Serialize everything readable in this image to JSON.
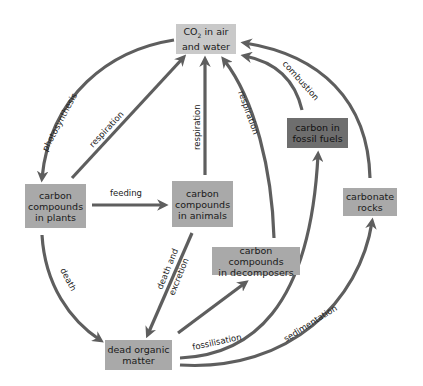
{
  "diagram": {
    "colors": {
      "arrow": "#5e5e5e",
      "box_light": "#c9c9c9",
      "box_mid": "#a9a9a9",
      "box_dark": "#6e6e6e"
    },
    "nodes": {
      "co2": {
        "line1": "CO",
        "sub": "2",
        "line1b": " in air",
        "line2": "and water"
      },
      "plants": {
        "line1": "carbon",
        "line2": "compounds",
        "line3": "in plants"
      },
      "animals": {
        "line1": "carbon",
        "line2": "compounds",
        "line3": "in animals"
      },
      "decomposers": {
        "line1": "carbon compounds",
        "line2": "in decomposers"
      },
      "dead_matter": {
        "line1": "dead organic",
        "line2": "matter"
      },
      "fossil_fuels": {
        "line1": "carbon in",
        "line2": "fossil fuels"
      },
      "carbonate_rocks": {
        "line1": "carbonate",
        "line2": "rocks"
      }
    },
    "edges": [
      {
        "from": "co2",
        "to": "plants",
        "label": "photosynthesis"
      },
      {
        "from": "plants",
        "to": "co2",
        "label": "respiration"
      },
      {
        "from": "animals",
        "to": "co2",
        "label": "respiration"
      },
      {
        "from": "decomposers",
        "to": "co2",
        "label": "respiration"
      },
      {
        "from": "fossil_fuels",
        "to": "co2",
        "label": "combustion"
      },
      {
        "from": "carbonate_rocks",
        "to": "co2",
        "label": "weathering and volcanic activity"
      },
      {
        "from": "plants",
        "to": "animals",
        "label": "feeding"
      },
      {
        "from": "plants",
        "to": "dead_matter",
        "label": "death"
      },
      {
        "from": "animals",
        "to": "dead_matter",
        "label_line1": "death and",
        "label_line2": "excretion"
      },
      {
        "from": "dead_matter",
        "to": "decomposers",
        "label": ""
      },
      {
        "from": "dead_matter",
        "to": "fossil_fuels",
        "label": "fossilisation"
      },
      {
        "from": "dead_matter",
        "to": "carbonate_rocks",
        "label": "sedimentation"
      }
    ]
  }
}
